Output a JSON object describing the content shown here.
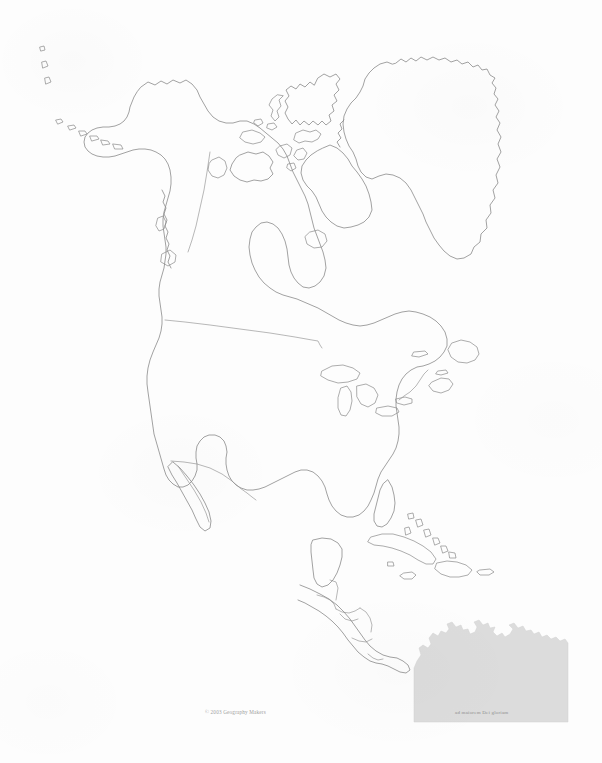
{
  "document": {
    "title": "North America Outline Map",
    "page_width": 602,
    "page_height": 763,
    "background_color": "#fdfdfd"
  },
  "map": {
    "region": "North America",
    "style": "blank outline / political boundaries",
    "outline_color": "#8a8a8a",
    "shaded_color": "#dcdcdc",
    "features": [
      "Alaska",
      "Aleutian Islands",
      "Canada",
      "Greenland",
      "Canadian Arctic Archipelago",
      "Hudson Bay",
      "Baffin Island",
      "Newfoundland",
      "Nova Scotia",
      "United States",
      "Great Lakes",
      "Florida",
      "Baja California",
      "Mexico",
      "Yucatan Peninsula",
      "Guatemala",
      "Belize",
      "Honduras",
      "El Salvador",
      "Nicaragua",
      "Costa Rica",
      "Panama",
      "Cuba",
      "Bahamas",
      "Jamaica",
      "Hispaniola",
      "Puerto Rico",
      "South America (shaded)"
    ]
  },
  "captions": {
    "copyright": "© 2003 Geography Makers",
    "watermark": "ad maiorem Dei gloriam"
  }
}
